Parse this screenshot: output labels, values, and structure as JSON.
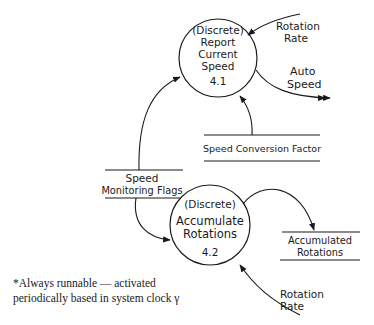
{
  "diagram": {
    "type": "data-flow-diagram",
    "stroke_color": "#1a1a1a",
    "background": "#ffffff",
    "processes": [
      {
        "id": "4.1",
        "lines": [
          "(Discrete)",
          "Report",
          "Current",
          "Speed"
        ],
        "number": "4.1"
      },
      {
        "id": "4.2",
        "lines": [
          "(Discrete)",
          "Accumulate",
          "Rotations"
        ],
        "number": "4.2"
      }
    ],
    "stores": [
      {
        "id": "speed-conversion-factor",
        "lines": [
          "Speed Conversion Factor"
        ]
      },
      {
        "id": "speed-monitoring-flags",
        "lines": [
          "Speed",
          "Monitoring Flags"
        ]
      },
      {
        "id": "accumulated-rotations",
        "lines": [
          "Accumulated",
          "Rotations"
        ]
      }
    ],
    "flows": [
      {
        "id": "rotation-rate-in-4-1",
        "lines": [
          "Rotation",
          "Rate"
        ]
      },
      {
        "id": "auto-speed-out",
        "lines": [
          "Auto",
          "Speed"
        ]
      },
      {
        "id": "rotation-rate-in-4-2",
        "lines": [
          "Rotation",
          "Rate"
        ]
      }
    ],
    "footnote": {
      "line1": "*Always runnable — activated",
      "line2": "periodically based in system clock",
      "mark": "γ"
    }
  }
}
